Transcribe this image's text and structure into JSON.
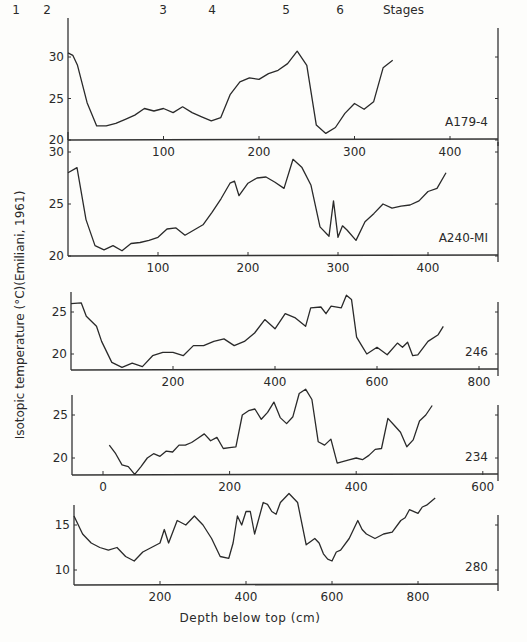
{
  "chart_data": {
    "type": "line",
    "title": "",
    "ylabel": "Isotopic temperature (°C)(Emiliani, 1961)",
    "xlabel": "Depth below top (cm)",
    "stages": {
      "label": "Stages",
      "items": [
        {
          "n": "1",
          "x": 16
        },
        {
          "n": "2",
          "x": 47
        },
        {
          "n": "3",
          "x": 163
        },
        {
          "n": "4",
          "x": 212
        },
        {
          "n": "5",
          "x": 286
        },
        {
          "n": "6",
          "x": 340
        }
      ]
    },
    "panels": [
      {
        "name": "A179-4",
        "x0px": 68,
        "xscale": 0.955,
        "axisY": 140,
        "yref": [
          30,
          57,
          20,
          140
        ],
        "xticks": [
          100,
          200,
          300,
          400
        ],
        "yticks": [
          20,
          25,
          30
        ],
        "xlim": [
          0,
          450
        ],
        "ylim": [
          20,
          31
        ],
        "x": [
          0,
          5,
          10,
          20,
          30,
          40,
          50,
          60,
          70,
          80,
          90,
          100,
          110,
          120,
          130,
          140,
          150,
          160,
          170,
          180,
          190,
          200,
          210,
          220,
          230,
          240,
          250,
          260,
          270,
          280,
          290,
          300,
          310,
          320,
          330,
          340
        ],
        "y": [
          30.5,
          30.2,
          29,
          24.5,
          21.7,
          21.7,
          22,
          22.5,
          23,
          23.8,
          23.5,
          23.8,
          23.3,
          24,
          23.3,
          22.8,
          22.3,
          22.7,
          25.5,
          27,
          27.5,
          27.3,
          28,
          28.4,
          29.2,
          30.7,
          29,
          21.8,
          20.8,
          21.5,
          23.2,
          24.4,
          23.7,
          24.6,
          28.7,
          29.6
        ]
      },
      {
        "name": "A240-MI",
        "x0px": 68,
        "xscale": 0.9,
        "axisY": 256,
        "yref": [
          30,
          152,
          20,
          256
        ],
        "xticks": [
          100,
          200,
          300,
          400
        ],
        "yticks": [
          20,
          25,
          30
        ],
        "xlim": [
          0,
          480
        ],
        "ylim": [
          20,
          31
        ],
        "x": [
          0,
          10,
          20,
          30,
          40,
          50,
          60,
          70,
          80,
          90,
          100,
          110,
          120,
          130,
          140,
          150,
          160,
          170,
          180,
          185,
          190,
          200,
          210,
          220,
          230,
          240,
          250,
          260,
          270,
          280,
          290,
          295,
          300,
          305,
          310,
          320,
          330,
          340,
          350,
          360,
          370,
          380,
          390,
          400,
          410,
          420
        ],
        "y": [
          28,
          28.5,
          23.5,
          21,
          20.6,
          21,
          20.5,
          21.2,
          21.3,
          21.5,
          21.8,
          22.6,
          22.7,
          22,
          22.5,
          23,
          24.2,
          25.5,
          27,
          27.2,
          25.8,
          27,
          27.5,
          27.6,
          27.1,
          26.5,
          29.3,
          28.5,
          26.8,
          22.8,
          21.9,
          25.3,
          21.8,
          22.9,
          22.5,
          21.5,
          23.3,
          24.1,
          25,
          24.6,
          24.8,
          24.9,
          25.3,
          26.2,
          26.5,
          28
        ]
      },
      {
        "name": "246",
        "x0px": 71,
        "xscale": 0.51,
        "axisY": 370,
        "yref": [
          25,
          312,
          20,
          354
        ],
        "xticks": [
          200,
          400,
          600,
          800
        ],
        "yticks": [
          20,
          25
        ],
        "xlim": [
          0,
          840
        ],
        "ylim": [
          18,
          27
        ],
        "x": [
          0,
          20,
          30,
          50,
          60,
          80,
          100,
          120,
          140,
          160,
          180,
          200,
          220,
          240,
          260,
          280,
          300,
          320,
          340,
          360,
          380,
          400,
          420,
          440,
          460,
          470,
          490,
          500,
          510,
          530,
          540,
          550,
          560,
          570,
          580,
          600,
          620,
          640,
          650,
          660,
          670,
          680,
          700,
          720,
          730
        ],
        "y": [
          26,
          26.1,
          24.5,
          23.3,
          21.5,
          19,
          18.4,
          18.9,
          18.5,
          19.8,
          20.2,
          20.2,
          19.8,
          21,
          21,
          21.5,
          21.8,
          21,
          21.5,
          22.5,
          24.1,
          23,
          24.8,
          24.3,
          23.3,
          25.5,
          25.6,
          24.8,
          25.7,
          25.5,
          27,
          26.5,
          22,
          21,
          20,
          20.8,
          19.9,
          21.3,
          20.8,
          21.4,
          19.8,
          19.9,
          21.5,
          22.3,
          23.3,
          23.1,
          21.7,
          22.5,
          24.2,
          24.4,
          26.5,
          27.1
        ]
      },
      {
        "name": "234",
        "x0px": 103,
        "xscale": 0.633,
        "axisY": 475,
        "yref": [
          25,
          415,
          20,
          458
        ],
        "xticks": [
          0,
          200,
          400,
          600
        ],
        "yticks": [
          20,
          25
        ],
        "xlim": [
          -20,
          600
        ],
        "ylim": [
          18,
          28
        ],
        "x": [
          10,
          20,
          30,
          40,
          50,
          60,
          70,
          80,
          90,
          100,
          110,
          120,
          130,
          140,
          150,
          160,
          170,
          180,
          190,
          200,
          210,
          220,
          230,
          240,
          250,
          260,
          270,
          280,
          290,
          300,
          310,
          320,
          330,
          340,
          350,
          360,
          370,
          380,
          390,
          400,
          410,
          420,
          430,
          440,
          450,
          460,
          470,
          480,
          490,
          500,
          510,
          520,
          530
        ],
        "y": [
          21.5,
          20.5,
          19.2,
          19,
          18.1,
          19,
          20,
          20.5,
          20.2,
          20.8,
          20.7,
          21.5,
          21.5,
          21.8,
          22.3,
          22.8,
          22,
          22.4,
          21.1,
          21.2,
          21.3,
          25,
          25.5,
          25.7,
          24.5,
          25.3,
          26.5,
          24.7,
          24,
          24.8,
          27.5,
          28,
          26.8,
          21.9,
          21.5,
          22.2,
          19.4,
          19.6,
          19.8,
          20,
          19.8,
          20.3,
          21,
          21.1,
          24.6,
          23.8,
          23,
          21.3,
          22.1,
          24.3,
          25,
          26.1
        ]
      },
      {
        "name": "280",
        "x0px": 74,
        "xscale": 0.43,
        "axisY": 585,
        "yref": [
          15,
          525,
          10,
          570
        ],
        "xticks": [
          200,
          400,
          600,
          800
        ],
        "yticks": [
          10,
          15
        ],
        "xlim": [
          0,
          1000
        ],
        "ylim": [
          9,
          19
        ],
        "x": [
          0,
          20,
          40,
          60,
          80,
          100,
          120,
          140,
          160,
          180,
          200,
          210,
          220,
          240,
          260,
          280,
          300,
          320,
          340,
          360,
          370,
          380,
          390,
          400,
          410,
          420,
          440,
          450,
          460,
          470,
          480,
          500,
          520,
          540,
          560,
          570,
          580,
          590,
          600,
          610,
          620,
          640,
          660,
          670,
          680,
          700,
          720,
          740,
          760,
          770,
          780,
          800,
          810,
          820,
          840
        ],
        "y": [
          16,
          14,
          13,
          12.5,
          12.2,
          12.5,
          11.5,
          11,
          12,
          12.5,
          13,
          14.5,
          13,
          15.5,
          15,
          16,
          15,
          13.5,
          11.5,
          11.3,
          13,
          16,
          15,
          16.5,
          16.5,
          14,
          17.5,
          17.3,
          16.5,
          16.2,
          17.5,
          18.5,
          17.5,
          12.8,
          13.5,
          13,
          11.8,
          11.2,
          11,
          12,
          12.2,
          13.5,
          15.5,
          14.5,
          14,
          13.5,
          14,
          14.2,
          15.5,
          15.8,
          16.7,
          16.3,
          17,
          17.2,
          18
        ]
      }
    ]
  }
}
